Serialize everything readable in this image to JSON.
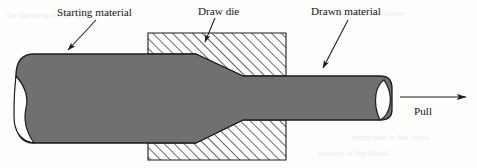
{
  "figure": {
    "background_color": "#fdfdfc",
    "material_fill": "#707070",
    "material_stroke": "#1c1c1c",
    "die_fill": "#ffffff",
    "die_hatch_color": "#1c1c1c",
    "line_color": "#1c1c1c",
    "text_color": "#17171a"
  },
  "labels": {
    "starting_material": "Starting material",
    "draw_die": "Draw die",
    "drawn_material": "Drawn material",
    "pull": "Pull"
  },
  "geometry": {
    "workpiece_left_x": 16,
    "workpiece_right_x": 392,
    "workpiece_top_y": 54,
    "workpiece_bottom_y": 143,
    "thick_section_half_height": 44,
    "thin_section_half_height": 22,
    "die_left_x": 148,
    "die_right_x": 286,
    "die_top_y": 33,
    "die_bottom_y": 160,
    "taper_start_x": 196,
    "taper_end_x": 252
  },
  "ghost_lines": [
    "the drawing of the bar",
    "material to the shape",
    "reduction in the cross",
    "section of the blank"
  ]
}
